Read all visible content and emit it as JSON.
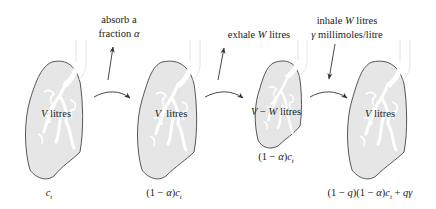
{
  "diagram": {
    "type": "process-flow",
    "colors": {
      "outline": "#444444",
      "fill": "#e6e6e6",
      "airway": "#ffffff",
      "arrow": "#333333"
    },
    "stages": [
      {
        "id": "lung-1",
        "volume_label": "V litres",
        "concentration": "c_t",
        "concentration_main": "c",
        "concentration_sub": "t"
      },
      {
        "id": "lung-2",
        "volume_label": "V litres",
        "concentration": "(1 − α)c_t",
        "concentration_main": "(1 − α)c",
        "concentration_sub": "t"
      },
      {
        "id": "lung-3",
        "volume_label": "V − W litres",
        "concentration": "(1 − α)c_t",
        "concentration_main": "(1 − α)c",
        "concentration_sub": "t"
      },
      {
        "id": "lung-4",
        "volume_label": "V litres",
        "concentration": "(1 − q)(1 − α)c_t + qγ",
        "concentration_main": "(1 − q)(1 − α)c",
        "concentration_sub": "t",
        "concentration_tail": " + qγ"
      }
    ],
    "actions": [
      {
        "id": "absorb",
        "line1": "absorb a",
        "line2": "fraction α",
        "direction": "up"
      },
      {
        "id": "exhale",
        "line1": "exhale W litres",
        "direction": "up"
      },
      {
        "id": "inhale",
        "line1": "inhale W litres",
        "line2": "γ millimoles/litre",
        "direction": "down"
      }
    ],
    "transitions": [
      "lung-1 → lung-2",
      "lung-2 → lung-3",
      "lung-3 → lung-4"
    ]
  }
}
